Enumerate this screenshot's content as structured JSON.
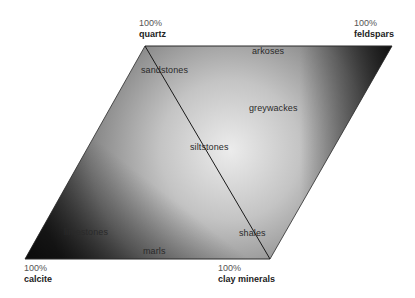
{
  "diagram": {
    "title": "",
    "type": "parallelogram composition diagram",
    "corners": [
      {
        "id": "quartz",
        "percent": "100%",
        "label": "quartz"
      },
      {
        "id": "feldspars",
        "percent": "100%",
        "label": "feldspars"
      },
      {
        "id": "calcite",
        "percent": "100%",
        "label": "calcite"
      },
      {
        "id": "clay",
        "percent": "100%",
        "label": "clay minerals"
      }
    ],
    "regions": [
      {
        "id": "arkoses",
        "label": "arkoses"
      },
      {
        "id": "sandstones",
        "label": "sandstones"
      },
      {
        "id": "greywackes",
        "label": "greywackes"
      },
      {
        "id": "siltstones",
        "label": "siltstones"
      },
      {
        "id": "limestones",
        "label": "limestones"
      },
      {
        "id": "shales",
        "label": "shales"
      },
      {
        "id": "marls",
        "label": "marls"
      }
    ],
    "colors": {
      "dark": "#1e1e1e",
      "mid": "#8a8a8a",
      "light": "#e8e8e8",
      "line": "#1a1a1a"
    }
  }
}
